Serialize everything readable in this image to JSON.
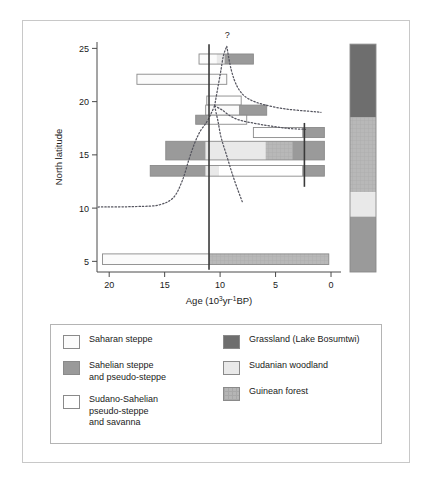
{
  "figure": {
    "background": "#ffffff",
    "frame_color": "#c8c8c8"
  },
  "axes": {
    "y_title": "North latitude",
    "y_ticks": [
      "25",
      "20",
      "15",
      "10",
      "5"
    ],
    "y_tick_values": [
      25,
      20,
      15,
      10,
      5
    ],
    "y_range": [
      4,
      25.6
    ],
    "x_title_main": "Age (10",
    "x_title_sup1": "3",
    "x_title_mid": "yr",
    "x_title_sup2": "-1",
    "x_title_end": "BP)",
    "x_ticks": [
      "20",
      "15",
      "10",
      "5",
      "0"
    ],
    "x_tick_values": [
      20,
      15,
      10,
      5,
      0
    ],
    "x_range": [
      21.1,
      -0.9
    ],
    "annotation_question": "?"
  },
  "colors": {
    "saharan_steppe": "#fbfbfb",
    "sahelian_steppe": "#9a9a9a",
    "sudano_sahelian": "#ffffff",
    "grassland": "#6e6e6e",
    "sudanian_woodland": "#e9e9e9",
    "guinean_forest": "#b5b5b5",
    "outline": "#8a8a8a",
    "axis": "#4a4a4a",
    "reference_line": "#3a3a3a",
    "dotted_curve": "#55555f"
  },
  "chart_data": {
    "type": "bar",
    "title": "",
    "xlabel": "Age (10^3 yr^-1 BP)",
    "ylabel": "North latitude",
    "xlim": [
      21.1,
      -0.9
    ],
    "ylim": [
      4,
      25.6
    ],
    "x_inverted": true,
    "grid": false,
    "legend_position": "below-plot",
    "bars": [
      {
        "id": "bar-lat24",
        "latitude": 24.0,
        "height_lat": 0.95,
        "segments": [
          {
            "x_start": 11.9,
            "x_end": 10.3,
            "fill": "saharan_steppe"
          },
          {
            "x_start": 10.3,
            "x_end": 9.6,
            "fill": "sudanian_woodland"
          },
          {
            "x_start": 9.6,
            "x_end": 7.0,
            "fill": "sahelian_steppe"
          }
        ]
      },
      {
        "id": "bar-lat22",
        "latitude": 22.1,
        "height_lat": 0.95,
        "segments": [
          {
            "x_start": 17.5,
            "x_end": 9.4,
            "fill": "saharan_steppe"
          }
        ]
      },
      {
        "id": "bar-lat20",
        "latitude": 20.1,
        "height_lat": 0.85,
        "segments": [
          {
            "x_start": 11.2,
            "x_end": 8.1,
            "fill": "sudano_sahelian"
          }
        ]
      },
      {
        "id": "bar-lat19",
        "latitude": 19.2,
        "height_lat": 0.95,
        "segments": [
          {
            "x_start": 11.3,
            "x_end": 8.3,
            "fill": "saharan_steppe"
          },
          {
            "x_start": 8.3,
            "x_end": 5.8,
            "fill": "sahelian_steppe"
          }
        ]
      },
      {
        "id": "bar-lat18",
        "latitude": 18.3,
        "height_lat": 0.85,
        "segments": [
          {
            "x_start": 12.2,
            "x_end": 11.1,
            "fill": "sahelian_steppe"
          },
          {
            "x_start": 11.1,
            "x_end": 7.6,
            "fill": "sudano_sahelian"
          }
        ]
      },
      {
        "id": "bar-lat17",
        "latitude": 17.1,
        "height_lat": 0.95,
        "segments": [
          {
            "x_start": 7.0,
            "x_end": 2.6,
            "fill": "sudano_sahelian"
          },
          {
            "x_start": 2.6,
            "x_end": 0.6,
            "fill": "sahelian_steppe"
          }
        ]
      },
      {
        "id": "bar-lat15",
        "latitude": 15.4,
        "height_lat": 1.75,
        "segments": [
          {
            "x_start": 14.9,
            "x_end": 11.3,
            "fill": "sahelian_steppe"
          },
          {
            "x_start": 11.3,
            "x_end": 5.9,
            "fill": "sudanian_woodland"
          },
          {
            "x_start": 5.9,
            "x_end": 3.5,
            "fill": "guinean_forest"
          },
          {
            "x_start": 3.5,
            "x_end": 0.6,
            "fill": "sahelian_steppe"
          }
        ]
      },
      {
        "id": "bar-lat13",
        "latitude": 13.5,
        "height_lat": 1.0,
        "segments": [
          {
            "x_start": 16.3,
            "x_end": 11.3,
            "fill": "sahelian_steppe"
          },
          {
            "x_start": 11.3,
            "x_end": 10.1,
            "fill": "sudanian_woodland"
          },
          {
            "x_start": 10.1,
            "x_end": 2.6,
            "fill": "sudano_sahelian"
          },
          {
            "x_start": 2.6,
            "x_end": 0.6,
            "fill": "sahelian_steppe"
          }
        ]
      },
      {
        "id": "bar-lat5",
        "latitude": 5.2,
        "height_lat": 1.0,
        "segments": [
          {
            "x_start": 20.6,
            "x_end": 11.0,
            "fill": "saharan_steppe"
          },
          {
            "x_start": 11.0,
            "x_end": 0.2,
            "fill": "guinean_forest"
          }
        ]
      }
    ],
    "reference_lines": [
      {
        "id": "ref-line-11ka",
        "x": 11.0,
        "y_top": 25.4,
        "y_bottom": 4.2
      },
      {
        "id": "ref-line-2ka",
        "x": 2.4,
        "y_top": 18.0,
        "y_bottom": 12.0
      }
    ],
    "vegetation_strip": {
      "id": "vegetation-zone-strip",
      "bands": [
        {
          "fill": "grassland",
          "lat_top": 25.4,
          "lat_bottom": 18.5
        },
        {
          "fill": "guinean_forest",
          "lat_top": 18.5,
          "lat_bottom": 11.5
        },
        {
          "fill": "sudanian_woodland",
          "lat_top": 11.5,
          "lat_bottom": 9.2
        },
        {
          "fill": "sahelian_steppe",
          "lat_top": 9.2,
          "lat_bottom": 4.0
        }
      ]
    },
    "dotted_curves": [
      {
        "id": "curve-lower-boundary",
        "points": [
          [
            21.0,
            10.1
          ],
          [
            17.5,
            10.15
          ],
          [
            15.5,
            10.3
          ],
          [
            14.2,
            11.0
          ],
          [
            13.4,
            12.6
          ],
          [
            12.8,
            14.6
          ],
          [
            12.3,
            16.1
          ],
          [
            11.8,
            17.2
          ],
          [
            11.2,
            18.1
          ],
          [
            10.8,
            18.9
          ],
          [
            10.5,
            19.6
          ]
        ]
      },
      {
        "id": "curve-upper-right-1",
        "points": [
          [
            10.5,
            19.6
          ],
          [
            10.0,
            22.5
          ],
          [
            9.7,
            24.3
          ],
          [
            9.4,
            25.2
          ]
        ]
      },
      {
        "id": "curve-fan-a",
        "points": [
          [
            9.4,
            25.2
          ],
          [
            9.0,
            23.0
          ],
          [
            8.4,
            21.3
          ],
          [
            7.5,
            20.3
          ],
          [
            6.0,
            19.7
          ],
          [
            4.0,
            19.3
          ],
          [
            2.0,
            19.1
          ],
          [
            0.9,
            19.0
          ]
        ]
      },
      {
        "id": "curve-fan-b",
        "points": [
          [
            10.5,
            19.6
          ],
          [
            9.8,
            19.2
          ],
          [
            9.0,
            18.6
          ],
          [
            8.0,
            18.2
          ],
          [
            6.0,
            17.8
          ],
          [
            4.0,
            17.5
          ],
          [
            2.3,
            17.4
          ]
        ]
      },
      {
        "id": "curve-fan-c",
        "points": [
          [
            10.5,
            19.6
          ],
          [
            10.2,
            18.2
          ],
          [
            9.9,
            16.6
          ],
          [
            9.4,
            14.9
          ],
          [
            8.9,
            13.2
          ],
          [
            8.4,
            11.7
          ],
          [
            8.0,
            10.6
          ]
        ]
      }
    ]
  },
  "legend": {
    "columns": [
      {
        "id": "legend-column-left",
        "entries": [
          {
            "id": "legend-saharan-steppe",
            "label": "Saharan steppe",
            "fill": "saharan_steppe"
          },
          {
            "id": "legend-sahelian-steppe",
            "label": "Sahelian steppe\nand pseudo-steppe",
            "fill": "sahelian_steppe"
          },
          {
            "id": "legend-sudano-sahelian",
            "label": "Sudano-Sahelian\npseudo-steppe\nand savanna",
            "fill": "sudano_sahelian"
          }
        ]
      },
      {
        "id": "legend-column-right",
        "entries": [
          {
            "id": "legend-grassland",
            "label": "Grassland (Lake Bosumtwi)",
            "fill": "grassland"
          },
          {
            "id": "legend-sudanian-woodland",
            "label": "Sudanian woodland",
            "fill": "sudanian_woodland"
          },
          {
            "id": "legend-guinean-forest",
            "label": "Guinean forest",
            "fill": "guinean_forest"
          }
        ]
      }
    ]
  }
}
